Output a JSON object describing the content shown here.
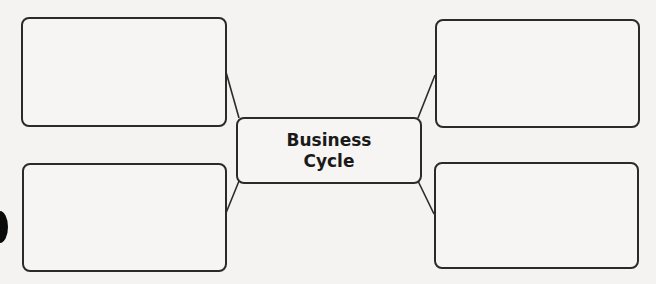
{
  "diagram": {
    "type": "concept-web",
    "center": {
      "label": "Business\nCycle"
    },
    "outer_boxes": [
      {
        "position": "top-left",
        "label": ""
      },
      {
        "position": "top-right",
        "label": ""
      },
      {
        "position": "bottom-left",
        "label": ""
      },
      {
        "position": "bottom-right",
        "label": ""
      }
    ],
    "colors": {
      "stroke": "#2a2a2a",
      "background": "#f4f3f1",
      "text": "#1a1a1a"
    }
  }
}
